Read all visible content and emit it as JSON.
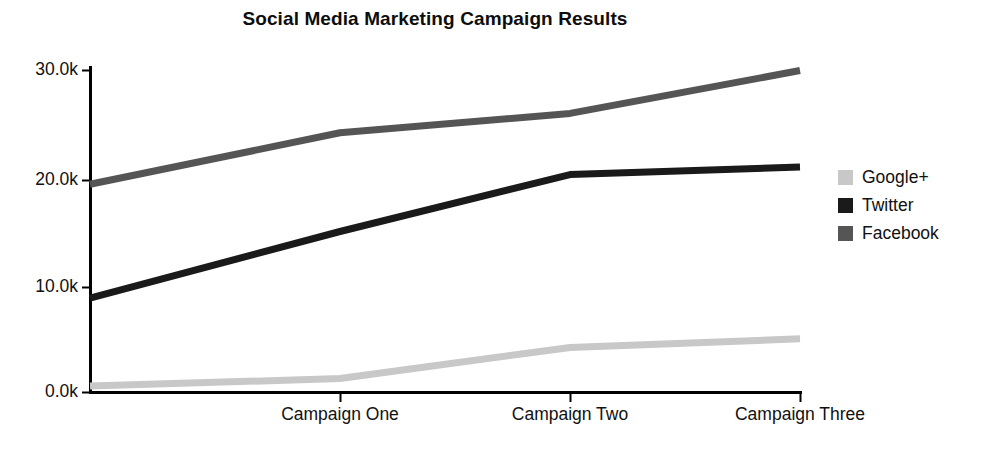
{
  "chart_data": {
    "type": "line",
    "title": "Social Media Marketing Campaign Results",
    "xlabel": "",
    "ylabel": "",
    "categories": [
      "",
      "Campaign One",
      "Campaign Two",
      "Campaign Three"
    ],
    "x_tick_labels": [
      "",
      "Campaign One",
      "Campaign Two",
      "Campaign Three"
    ],
    "y_tick_labels": [
      "0.0k",
      "10.0k",
      "20.0k",
      "30.0k"
    ],
    "y_tick_values": [
      0,
      10000,
      20000,
      30000
    ],
    "ylim": [
      0,
      31000
    ],
    "grid": false,
    "legend_position": "right",
    "series": [
      {
        "name": "Google+",
        "color": "#c8c8c8",
        "values": [
          600,
          1300,
          4200,
          5000
        ]
      },
      {
        "name": "Twitter",
        "color": "#1a1a1a",
        "values": [
          8800,
          15000,
          20300,
          21000
        ]
      },
      {
        "name": "Facebook",
        "color": "#555555",
        "values": [
          19400,
          24200,
          26000,
          30000
        ]
      }
    ]
  },
  "legend": {
    "entries": [
      {
        "label": "Google+",
        "swatch_color": "#c8c8c8"
      },
      {
        "label": "Twitter",
        "swatch_color": "#1a1a1a"
      },
      {
        "label": "Facebook",
        "swatch_color": "#555555"
      }
    ]
  },
  "axes": {
    "y_labels": [
      "30.0k",
      "20.0k",
      "10.0k",
      "0.0k"
    ],
    "x_labels": [
      "Campaign One",
      "Campaign Two",
      "Campaign Three"
    ],
    "axis_color": "#000000"
  }
}
